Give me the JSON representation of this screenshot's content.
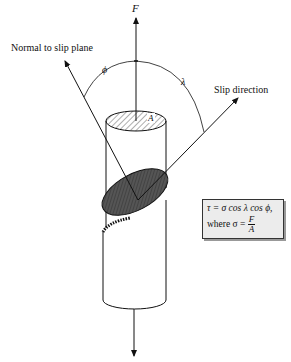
{
  "diagram": {
    "labels": {
      "force": "F",
      "normal": "Normal to slip plane",
      "slip_direction": "Slip direction",
      "phi": "ϕ",
      "lambda": "λ",
      "area": "A"
    },
    "formula": {
      "line1": "τ = σ cos λ cos ϕ,",
      "line2_prefix": "where σ = ",
      "numerator": "F",
      "denominator": "A"
    },
    "colors": {
      "line": "#111111",
      "hatch_fill": "#555555",
      "box_fill": "#ececec"
    }
  }
}
